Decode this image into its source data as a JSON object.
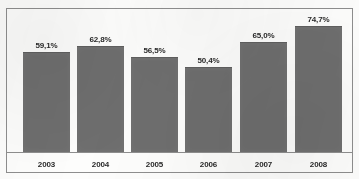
{
  "chart_data": {
    "type": "bar",
    "title": "",
    "subtitle": "",
    "xlabel": "",
    "ylabel": "",
    "categories": [
      "2003",
      "2004",
      "2005",
      "2006",
      "2007",
      "2008"
    ],
    "values": [
      59.1,
      62.8,
      56.5,
      50.4,
      65.0,
      74.7
    ],
    "value_labels": [
      "59,1%",
      "62,8%",
      "56,5%",
      "50,4%",
      "65,0%",
      "74,7%"
    ],
    "decimal_separator": ",",
    "unit": "%",
    "ylim": [
      0,
      80
    ],
    "grid": false,
    "legend": null,
    "legend_position": "none",
    "bar_color": "#6e6e6e",
    "axis_color": "#8e8e8e",
    "border_color": "#8e8e8e",
    "background_color": "#fdfdfc",
    "text_color": "#2b2b2b",
    "series": [
      {
        "name": "",
        "values": [
          59.1,
          62.8,
          56.5,
          50.4,
          65.0,
          74.7
        ]
      }
    ]
  },
  "frame": {
    "has_outer_border": true,
    "has_baseline": true
  }
}
